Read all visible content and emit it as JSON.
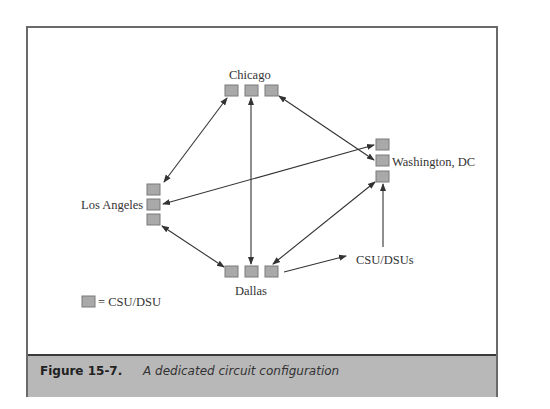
{
  "diagram": {
    "nodes": {
      "chicago": "Chicago",
      "washington": "Washington, DC",
      "los_angeles": "Los Angeles",
      "dallas": "Dallas"
    },
    "callout": "CSU/DSUs",
    "legend": "= CSU/DSU",
    "colors": {
      "box_fill": "#a9a9a9",
      "box_stroke": "#7a7a7a",
      "line": "#333333",
      "frame": "#6a6a6a",
      "caption_bg": "#b8b8b8"
    }
  },
  "caption": {
    "number": "Figure 15-7.",
    "text": "A dedicated circuit configuration"
  }
}
